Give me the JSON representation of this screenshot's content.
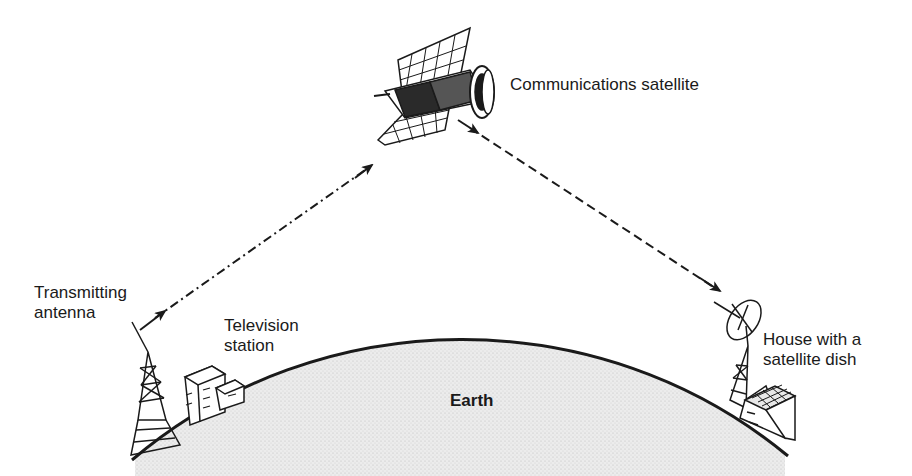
{
  "diagram": {
    "labels": {
      "satellite": "Communications satellite",
      "transmitter": "Transmitting\nantenna",
      "station": "Television\nstation",
      "house": "House with a\nsatellite dish",
      "earth": "Earth"
    },
    "links": [
      {
        "from": "Transmitting antenna",
        "to": "Communications satellite",
        "style": "dash-dot",
        "direction": "up"
      },
      {
        "from": "Communications satellite",
        "to": "House with a satellite dish",
        "style": "dashed",
        "direction": "down"
      }
    ],
    "colors": {
      "ink": "#1a1a1a",
      "earth_fill": "#e6e6e6",
      "background": "#ffffff"
    }
  }
}
